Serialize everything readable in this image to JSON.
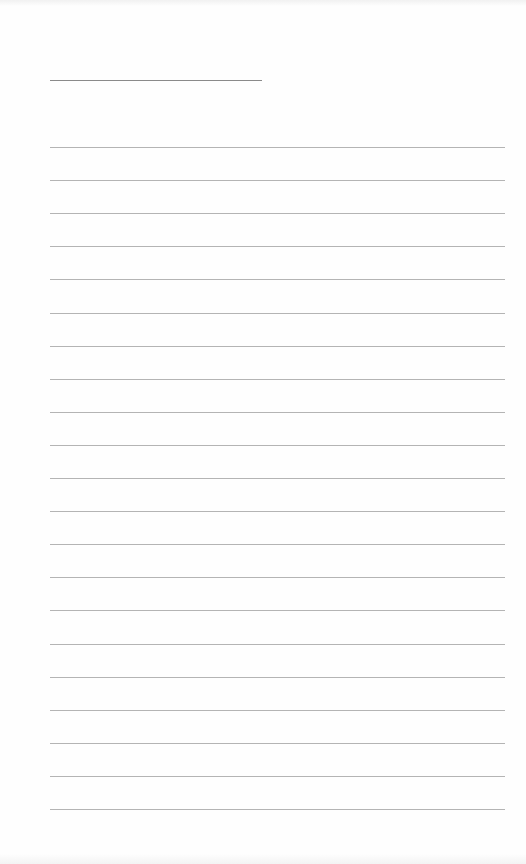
{
  "sheet": {
    "type": "lined-paper",
    "title_line": {
      "x": 50,
      "y": 80,
      "width": 212,
      "color": "#8a8a8a"
    },
    "rules": {
      "count": 21,
      "start_y": 147,
      "spacing": 33.1,
      "x": 50,
      "width": 455,
      "color": "#b4b4b4"
    },
    "background": "#fefefe"
  }
}
